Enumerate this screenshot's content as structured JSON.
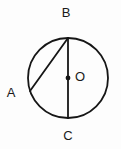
{
  "figure": {
    "background_color": "#fdfdfd",
    "stroke_color": "#161616",
    "label_color": "#1a1a1a"
  },
  "circle": {
    "center_x": 68,
    "center_y": 78,
    "radius": 40,
    "stroke_width": 1.8
  },
  "points": {
    "B": {
      "x": 68,
      "y": 38,
      "label": "B",
      "label_x": 66,
      "label_y": 14
    },
    "C": {
      "x": 68,
      "y": 118,
      "label": "C",
      "label_x": 68,
      "label_y": 137
    },
    "A": {
      "x": 30,
      "y": 91,
      "label": "A",
      "label_x": 11,
      "label_y": 94
    },
    "O": {
      "x": 68,
      "y": 78,
      "label": "O",
      "label_x": 80,
      "label_y": 78,
      "dot_radius": 2.4
    }
  },
  "segments": [
    {
      "name": "diameter-bc",
      "x1": 68,
      "y1": 38,
      "x2": 68,
      "y2": 118,
      "stroke_width": 1.8
    },
    {
      "name": "chord-ba",
      "x1": 68,
      "y1": 38,
      "x2": 30,
      "y2": 91,
      "stroke_width": 1.8
    }
  ]
}
